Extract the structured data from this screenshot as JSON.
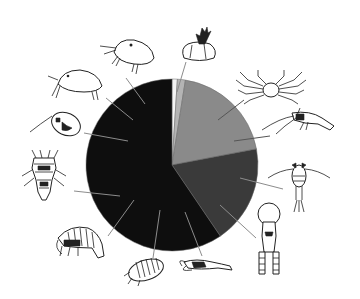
{
  "chart_data": {
    "type": "pie",
    "title": "",
    "legend": "none — slices labeled by crustacean illustrations placed around the pie",
    "start_angle_deg": 0,
    "direction": "clockwise",
    "slices": [
      {
        "label": "white sliver",
        "value": 1.0,
        "color": "#f4f4f4"
      },
      {
        "label": "light gray sliver",
        "value": 1.5,
        "color": "#b4b4b4"
      },
      {
        "label": "medium gray",
        "value": 19.5,
        "color": "#8a8a8a"
      },
      {
        "label": "dark gray",
        "value": 18.5,
        "color": "#3a3a3a"
      },
      {
        "label": "black",
        "value": 59.5,
        "color": "#0e0e0e"
      }
    ],
    "illustrations": [
      {
        "name": "barnacle",
        "position": "top",
        "points_to": "light gray sliver"
      },
      {
        "name": "crab",
        "position": "upper-right",
        "points_to": "medium gray"
      },
      {
        "name": "shrimp",
        "position": "right",
        "points_to": "medium gray"
      },
      {
        "name": "copepod",
        "position": "right-lower",
        "points_to": "dark gray"
      },
      {
        "name": "copepod-larva",
        "position": "lower-right",
        "points_to": "dark gray"
      },
      {
        "name": "mysid-shrimp",
        "position": "bottom",
        "points_to": "black"
      },
      {
        "name": "isopod",
        "position": "bottom-left",
        "points_to": "black"
      },
      {
        "name": "amphipod",
        "position": "lower-left",
        "points_to": "black"
      },
      {
        "name": "harpacticoid",
        "position": "left",
        "points_to": "black"
      },
      {
        "name": "cladoceran",
        "position": "upper-left",
        "points_to": "black"
      },
      {
        "name": "ostracod-a",
        "position": "upper-left",
        "points_to": "black"
      },
      {
        "name": "ostracod-b",
        "position": "top-left",
        "points_to": "black"
      }
    ]
  },
  "colors": {
    "background": "#ffffff",
    "leader_line": "#8c8c8c"
  }
}
